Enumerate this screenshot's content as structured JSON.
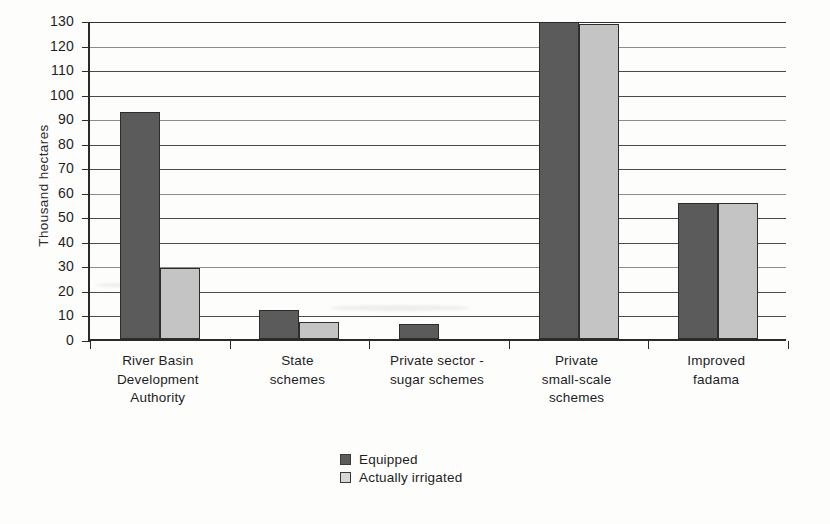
{
  "chart_data": {
    "type": "bar",
    "title": "",
    "xlabel": "",
    "ylabel": "Thousand hectares",
    "ylim": [
      0,
      130
    ],
    "ytick_step": 10,
    "yticks": [
      "130",
      "120",
      "110",
      "100",
      "90",
      "80",
      "70",
      "60",
      "50",
      "40",
      "30",
      "20",
      "10",
      "0"
    ],
    "grid": true,
    "legend_position": "bottom-center",
    "categories": [
      "River Basin Development Authority",
      "State schemes",
      "Private sector - sugar schemes",
      "Private small-scale schemes",
      "Improved fadama"
    ],
    "category_lines": [
      [
        "River Basin",
        "Development",
        "Authority"
      ],
      [
        "State",
        "schemes"
      ],
      [
        "Private sector -",
        "sugar schemes"
      ],
      [
        "Private",
        "small-scale",
        "schemes"
      ],
      [
        "Improved",
        "fadama"
      ]
    ],
    "series": [
      {
        "name": "Equipped",
        "color": "#5b5b5b",
        "values": [
          92.5,
          12,
          6,
          129,
          55.5
        ]
      },
      {
        "name": "Actually irrigated",
        "color": "#c4c4c4",
        "values": [
          29,
          7,
          0,
          128.5,
          55.5
        ]
      }
    ]
  },
  "axis": {
    "y_title": "Thousand hectares"
  },
  "legend": {
    "items": [
      {
        "label": "Equipped",
        "swatch": "dark-gray-swatch"
      },
      {
        "label": "Actually irrigated",
        "swatch": "light-gray-swatch"
      }
    ]
  }
}
